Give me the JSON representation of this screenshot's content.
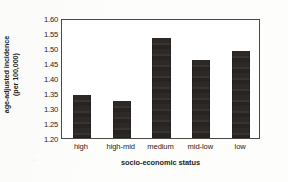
{
  "chart_data": {
    "type": "bar",
    "title": "",
    "xlabel": "socio-economic status",
    "ylabel_line1": "age-adjusted incidence",
    "ylabel_line2": "(per 100,000)",
    "categories": [
      "high",
      "high-mid",
      "medium",
      "mid-low",
      "low"
    ],
    "values": [
      1.345,
      1.325,
      1.535,
      1.46,
      1.49
    ],
    "ylim": [
      1.2,
      1.6
    ],
    "ytick_labels": [
      "1.60",
      "1.55",
      "1.50",
      "1.45",
      "1.40",
      "1.35",
      "1.30",
      "1.25",
      "1.20"
    ],
    "ytick_values": [
      1.6,
      1.55,
      1.5,
      1.45,
      1.4,
      1.35,
      1.3,
      1.25,
      1.2
    ],
    "grid": false,
    "legend": false,
    "bar_color": "#2e2b29",
    "axis_color": "#4a4745"
  }
}
